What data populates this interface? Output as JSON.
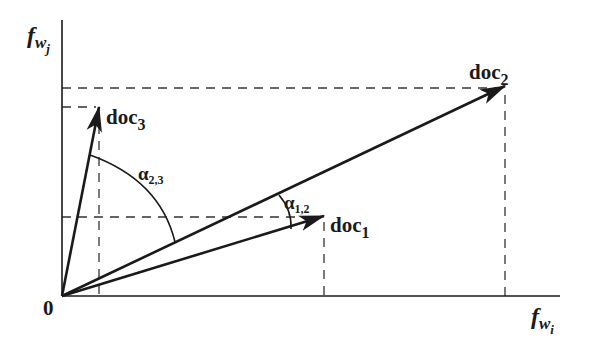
{
  "diagram": {
    "axes": {
      "x_label_main": "f",
      "x_label_sub": "w",
      "x_label_subsub": "i",
      "y_label_main": "f",
      "y_label_sub": "w",
      "y_label_subsub": "j",
      "origin_label": "0"
    },
    "vectors": [
      {
        "id": "doc1",
        "label_main": "doc",
        "label_sub": "1"
      },
      {
        "id": "doc2",
        "label_main": "doc",
        "label_sub": "2"
      },
      {
        "id": "doc3",
        "label_main": "doc",
        "label_sub": "3"
      }
    ],
    "angles": [
      {
        "id": "alpha12",
        "symbol": "α",
        "sub": "1,2"
      },
      {
        "id": "alpha23",
        "symbol": "α",
        "sub": "2,3"
      }
    ],
    "colors": {
      "ink": "#1a1a1a",
      "dash": "#333333",
      "background": "#ffffff"
    }
  }
}
